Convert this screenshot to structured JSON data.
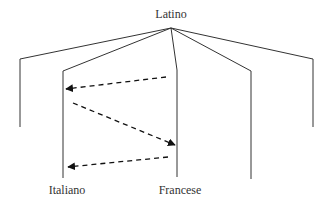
{
  "diagram": {
    "root_label": "Latino",
    "leaf_labels": {
      "italiano": "Italiano",
      "francese": "Francese"
    },
    "colors": {
      "line": "#333333",
      "arrow": "#111111",
      "background": "#ffffff"
    },
    "apex": [
      171,
      28
    ],
    "branches": [
      {
        "id": "b1",
        "bend": [
          20,
          59
        ],
        "end": [
          20,
          127
        ],
        "label": ""
      },
      {
        "id": "b2",
        "bend": [
          63,
          71
        ],
        "end": [
          63,
          178
        ],
        "label": "Italiano"
      },
      {
        "id": "b3",
        "bend": [
          177,
          70
        ],
        "end": [
          177,
          177
        ],
        "label": "Francese"
      },
      {
        "id": "b4",
        "bend": [
          251,
          71
        ],
        "end": [
          251,
          179
        ],
        "label": ""
      },
      {
        "id": "b5",
        "bend": [
          313,
          59
        ],
        "end": [
          313,
          127
        ],
        "label": ""
      }
    ],
    "arrows": [
      {
        "from": "Francese",
        "to": "Italiano",
        "start": [
          166,
          77
        ],
        "end": [
          66,
          89
        ],
        "style": "dashed"
      },
      {
        "from": "Italiano",
        "to": "Francese",
        "start": [
          73,
          103
        ],
        "end": [
          175,
          145
        ],
        "style": "dashed"
      },
      {
        "from": "Francese",
        "to": "Italiano",
        "start": [
          168,
          157
        ],
        "end": [
          68,
          167
        ],
        "style": "dashed"
      }
    ]
  }
}
